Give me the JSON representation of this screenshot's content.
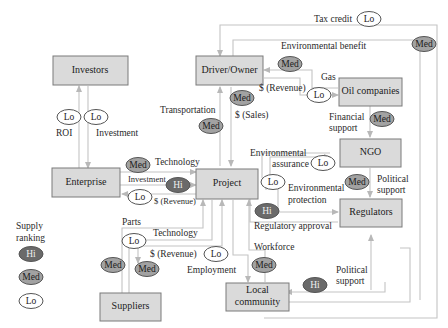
{
  "nodes": {
    "investors": "Investors",
    "driver_owner": "Driver/Owner",
    "oil_companies": "Oil companies",
    "ngo": "NGO",
    "enterprise": "Enterprise",
    "project": "Project",
    "regulators": "Regulators",
    "suppliers": "Suppliers",
    "local_community_line1": "Local",
    "local_community_line2": "community"
  },
  "edge_labels": {
    "tax_credit": "Tax credit",
    "environmental_benefit": "Environmental benefit",
    "gas": "Gas",
    "revenue_driver": "$ (Revenue)",
    "sales": "$ (Sales)",
    "transportation": "Transportation",
    "roi": "ROI",
    "investment": "Investment",
    "financial_support_1": "Financial",
    "financial_support_2": "support",
    "technology_enterprise": "Technology",
    "investment_enterprise": "Investment",
    "revenue_enterprise": "$ (Revenue)",
    "environmental_assurance_1": "Environmental",
    "environmental_assurance_2": "assurance",
    "environmental_protection_1": "Environmental",
    "environmental_protection_2": "protection",
    "political_support_ngo_1": "Political",
    "political_support_ngo_2": "support",
    "regulatory_approval": "Regulatory approval",
    "parts": "Parts",
    "technology_suppliers": "Technology",
    "revenue_suppliers": "$ (Revenue)",
    "employment": "Employment",
    "workforce": "Workforce",
    "political_support_community_1": "Political",
    "political_support_community_2": "support"
  },
  "badges": {
    "tax_credit": "Lo",
    "environmental_benefit": "Med",
    "gas_to_driver": "Med",
    "revenue_oil": "Lo",
    "sales": "Med",
    "transportation": "Med",
    "roi": "Lo",
    "investment_investors": "Lo",
    "financial_support": "Med",
    "technology_enterprise": "Med",
    "investment_enterprise": "Hi",
    "revenue_enterprise": "Lo",
    "environmental_assurance": "Lo",
    "environmental_protection": "Lo",
    "political_support_ngo": "Med",
    "regulatory_approval": "Hi",
    "technology_suppliers": "Lo",
    "parts": "Med",
    "revenue_suppliers": "Med",
    "employment": "Lo",
    "workforce": "Med",
    "political_support_community": "Hi"
  },
  "legend": {
    "title_1": "Supply",
    "title_2": "ranking",
    "items": [
      "Hi",
      "Med",
      "Lo"
    ]
  },
  "colors": {
    "box_fill": "#dadada",
    "box_stroke": "#7a7a7a",
    "edge": "#c4c4c4",
    "hi": "#6a6a6a",
    "med": "#a2a2a2",
    "lo": "#ffffff"
  }
}
